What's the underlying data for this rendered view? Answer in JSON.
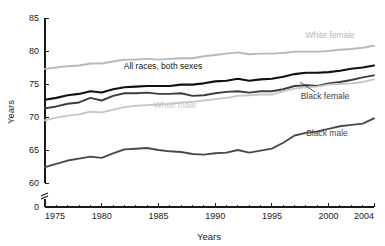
{
  "chart_data": {
    "type": "line",
    "title": "",
    "xlabel": "Years",
    "ylabel": "Years",
    "xlim": [
      1975,
      2004
    ],
    "ylim": [
      57.5,
      85
    ],
    "y_axis_break": true,
    "y_break_label": "0",
    "grid": false,
    "legend_position": "inline-labels",
    "x_tick_labels": [
      "1975",
      "1980",
      "1985",
      "1990",
      "1995",
      "2000",
      "2004"
    ],
    "x_tick_values": [
      1975,
      1980,
      1985,
      1990,
      1995,
      2000,
      2004
    ],
    "y_tick_labels": [
      "60",
      "65",
      "70",
      "75",
      "80",
      "85"
    ],
    "y_tick_values": [
      60,
      65,
      70,
      75,
      80,
      85
    ],
    "x": [
      1975,
      1976,
      1977,
      1978,
      1979,
      1980,
      1981,
      1982,
      1983,
      1984,
      1985,
      1986,
      1987,
      1988,
      1989,
      1990,
      1991,
      1992,
      1993,
      1994,
      1995,
      1996,
      1997,
      1998,
      1999,
      2000,
      2001,
      2002,
      2003,
      2004
    ],
    "series": [
      {
        "name": "White female",
        "label": "White female",
        "color": "#b8b8b8",
        "width": 1.9,
        "label_x": 330,
        "label_y": 38,
        "values": [
          77.3,
          77.5,
          77.7,
          77.8,
          78.1,
          78.1,
          78.4,
          78.7,
          78.7,
          78.8,
          78.7,
          78.8,
          78.9,
          78.9,
          79.2,
          79.4,
          79.6,
          79.8,
          79.5,
          79.6,
          79.6,
          79.7,
          79.9,
          79.9,
          79.9,
          80.0,
          80.2,
          80.3,
          80.5,
          80.8
        ]
      },
      {
        "name": "All races, both sexes",
        "label": "All races, both sexes",
        "color": "#111111",
        "width": 2.1,
        "label_x": 163,
        "label_y": 69,
        "values": [
          72.6,
          72.9,
          73.3,
          73.5,
          73.9,
          73.7,
          74.2,
          74.5,
          74.6,
          74.7,
          74.7,
          74.7,
          74.9,
          74.9,
          75.1,
          75.4,
          75.5,
          75.8,
          75.5,
          75.7,
          75.8,
          76.1,
          76.5,
          76.7,
          76.7,
          76.8,
          77.0,
          77.3,
          77.5,
          77.8
        ]
      },
      {
        "name": "Black female",
        "label": "Black female",
        "color": "#3d3d3d",
        "width": 1.9,
        "label_x": 325,
        "label_y": 99,
        "values": [
          71.3,
          71.6,
          72.0,
          72.2,
          72.9,
          72.5,
          73.2,
          73.6,
          73.6,
          73.7,
          73.5,
          73.5,
          73.6,
          73.2,
          73.3,
          73.6,
          73.8,
          73.9,
          73.7,
          73.9,
          73.9,
          74.2,
          74.7,
          74.8,
          74.7,
          75.1,
          75.3,
          75.6,
          76.0,
          76.3
        ]
      },
      {
        "name": "White male",
        "label": "White male",
        "color": "#c7c7c7",
        "width": 1.9,
        "label_x": 175,
        "label_y": 108,
        "values": [
          69.5,
          69.9,
          70.2,
          70.4,
          70.8,
          70.7,
          71.1,
          71.5,
          71.7,
          71.8,
          71.9,
          72.0,
          72.2,
          72.3,
          72.5,
          72.7,
          72.9,
          73.2,
          73.3,
          73.4,
          73.4,
          73.9,
          74.3,
          74.5,
          74.6,
          74.9,
          75.0,
          75.1,
          75.3,
          75.7
        ]
      },
      {
        "name": "Black male",
        "label": "Black male",
        "color": "#4a4a4a",
        "width": 1.9,
        "label_x": 327,
        "label_y": 136,
        "values": [
          62.4,
          62.9,
          63.4,
          63.7,
          64.0,
          63.8,
          64.5,
          65.1,
          65.2,
          65.3,
          65.0,
          64.8,
          64.7,
          64.4,
          64.3,
          64.5,
          64.6,
          65.0,
          64.6,
          64.9,
          65.2,
          66.1,
          67.2,
          67.6,
          67.8,
          68.2,
          68.6,
          68.8,
          69.0,
          69.8
        ]
      }
    ],
    "annotations": [
      {
        "name": "black-female-leader",
        "from_x": 300,
        "from_y": 82,
        "to_x": 315,
        "to_y": 92
      }
    ]
  },
  "axes": {
    "plot_left": 45,
    "plot_right": 374,
    "y_top_px": 18,
    "y_bottom_px": 183,
    "zero_px": 207,
    "tick_len": 4,
    "minor_tick_len": 2.5
  }
}
